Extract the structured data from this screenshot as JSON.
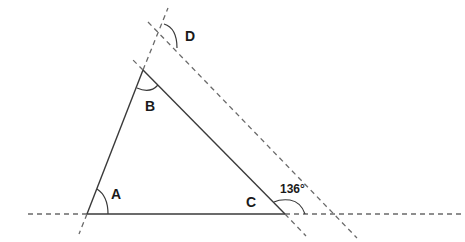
{
  "diagram": {
    "title": "",
    "type": "triangle-with-parallel-lines",
    "vertices": {
      "A": {
        "label": "A",
        "x": 87,
        "y": 214
      },
      "B": {
        "label": "B",
        "x": 143,
        "y": 70
      },
      "C": {
        "label": "C",
        "x": 285,
        "y": 214
      }
    },
    "labels": {
      "A": "A",
      "B": "B",
      "C": "C",
      "D": "D",
      "angle_C_exterior": "136°"
    },
    "angles": [
      {
        "name": "A",
        "marked": true
      },
      {
        "name": "B",
        "marked": true
      },
      {
        "name": "C",
        "marked": false
      },
      {
        "name": "D",
        "marked": true
      },
      {
        "name": "exterior at C",
        "value": "136°",
        "marked": true
      }
    ],
    "lines": {
      "baseline": "horizontal line through A and C, dashed beyond segment AC",
      "AB_extended": "line through A and B, dashed beyond segment AB",
      "BC_extended": "line through B and C, dashed beyond segment BC",
      "parallel_to_BC": "dashed line parallel to BC through D on extension of AB"
    },
    "colors": {
      "line": "#3a3a3a",
      "dashed": "#6a6a6a",
      "background": "#ffffff"
    }
  }
}
